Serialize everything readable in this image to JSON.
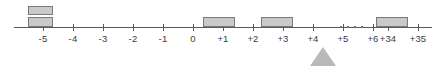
{
  "diagram": {
    "type": "number-line-block-diagram",
    "axis": {
      "name": "horizontal-number-line",
      "tick_labels": [
        "-5",
        "-4",
        "-3",
        "-2",
        "-1",
        "0",
        "+1",
        "+2",
        "+3",
        "+4",
        "+5",
        "+6",
        "+34",
        "+35"
      ],
      "tick_positions_px": [
        43,
        73,
        103,
        133,
        163,
        193,
        223,
        253,
        283,
        313,
        343,
        373,
        388,
        418
      ],
      "line_color": "#5a5a5a",
      "label_color": "#3b3b3b"
    },
    "break_indicator": {
      "name": "axis-break-ellipsis",
      "dot_count": 4,
      "label": "..."
    },
    "blocks": [
      {
        "label": "-5",
        "stack_level": 2,
        "x": 28,
        "y": 6,
        "width": 25,
        "height": 9
      },
      {
        "label": "-5",
        "stack_level": 1,
        "x": 28,
        "y": 17,
        "width": 25,
        "height": 10
      },
      {
        "label": "+2",
        "stack_level": 1,
        "x": 203,
        "y": 17,
        "width": 32,
        "height": 10
      },
      {
        "label": "+4",
        "stack_level": 1,
        "x": 261,
        "y": 17,
        "width": 32,
        "height": 10
      },
      {
        "label": "+34",
        "stack_level": 1,
        "x": 376,
        "y": 17,
        "width": 32,
        "height": 10
      }
    ],
    "marker": {
      "name": "triangle-pointer",
      "points_at": "+6",
      "x": 310,
      "y": 47,
      "color": "#b9b9b9"
    },
    "colors": {
      "block_fill": "#c9c9c9",
      "block_stroke": "#7a7a7a",
      "marker_fill": "#b9b9b9",
      "background": "#ffffff"
    }
  }
}
